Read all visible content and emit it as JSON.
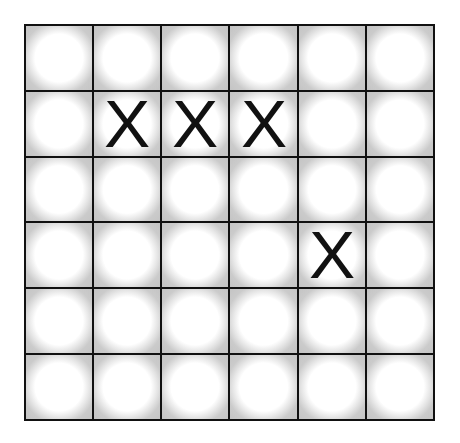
{
  "board": {
    "rows": 6,
    "cols": 6,
    "cells": [
      [
        "",
        "",
        "",
        "",
        "",
        ""
      ],
      [
        "",
        "X",
        "X",
        "X",
        "",
        ""
      ],
      [
        "",
        "",
        "",
        "",
        "",
        ""
      ],
      [
        "",
        "",
        "",
        "",
        "X",
        ""
      ],
      [
        "",
        "",
        "",
        "",
        "",
        ""
      ],
      [
        "",
        "",
        "",
        "",
        "",
        ""
      ]
    ]
  },
  "colors": {
    "grid_line": "#111111",
    "cell_edge": "#c4c4c4",
    "cell_center": "#ffffff",
    "mark": "#111111"
  }
}
